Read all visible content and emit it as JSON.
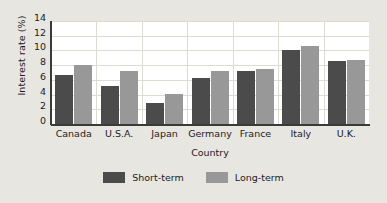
{
  "chart_data": {
    "type": "bar",
    "title": "",
    "subtitle": "",
    "xlabel": "Country",
    "ylabel": "Interest rate (%)",
    "categories": [
      "Canada",
      "U.S.A.",
      "Japan",
      "Germany",
      "France",
      "Italy",
      "U.K."
    ],
    "series": [
      {
        "name": "Short-term",
        "color": "#4b4b4b",
        "values": [
          6.7,
          5.1,
          2.8,
          6.2,
          7.2,
          10.1,
          8.6
        ]
      },
      {
        "name": "Long-term",
        "color": "#989898",
        "values": [
          8.0,
          7.2,
          4.1,
          7.2,
          7.5,
          10.6,
          8.7
        ]
      }
    ],
    "ylim": [
      0,
      14
    ],
    "yticks": [
      0,
      2,
      4,
      6,
      8,
      10,
      12,
      14
    ],
    "ytick_labels": [
      "0",
      "2",
      "4",
      "6",
      "8",
      "10",
      "12",
      "14"
    ],
    "grid": true,
    "grid_axis": "both",
    "legend_position": "bottom-center",
    "plot_background": "#ffffff",
    "figure_background": "#e8e6e1",
    "axis_color": "#3a3a3a",
    "grid_color": "#dedad4"
  },
  "legend": {
    "items": [
      {
        "label": "Short-term",
        "swatch": "legend-swatch-short-term"
      },
      {
        "label": "Long-term",
        "swatch": "legend-swatch-long-term"
      }
    ]
  }
}
